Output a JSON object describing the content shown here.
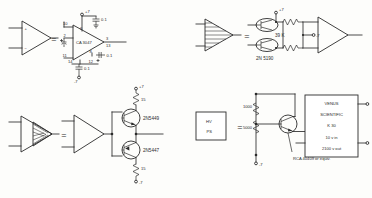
{
  "sheet": {
    "title": "Circuit symbol equivalence definitions",
    "equals_sign": "=",
    "line_color": "#2b2b2b",
    "background_color": "#fdfdfb"
  },
  "circuits": [
    {
      "id": "opamp",
      "name": "Operational amplifier equivalence",
      "symbol": {
        "type": "triangle-amplifier",
        "input_plus": "+",
        "input_minus": "−"
      },
      "device_label": "CA 3047",
      "pins": {
        "left_top": "10",
        "left_mid": "2",
        "left_bottom": "11",
        "right_top": "3",
        "right_mid": "13",
        "inner_top": "6",
        "inner_bottom": "8",
        "bottom_left": "14",
        "bottom_right": "12"
      },
      "supplies": {
        "positive": "+7",
        "negative": "-7"
      },
      "capacitors": [
        {
          "value": "0.1",
          "position": "top"
        },
        {
          "value": "0.1",
          "position": "right"
        },
        {
          "value": "0.1",
          "position": "bottom"
        }
      ]
    },
    {
      "id": "hatched-amp",
      "name": "Hatched driver amplifier equivalence",
      "symbol": {
        "type": "triangle-amplifier-hatched"
      },
      "device_label": "2N 5190",
      "resistor_value": "39 K",
      "supplies": {
        "positive": "+7",
        "negative": "-7"
      }
    },
    {
      "id": "power-buffer",
      "name": "Complementary emitter follower buffer equivalence",
      "symbol": {
        "type": "triangle-amplifier-shaded"
      },
      "transistors": [
        {
          "label": "2N5449",
          "polarity": "npn"
        },
        {
          "label": "2N5447",
          "polarity": "pnp"
        }
      ],
      "resistors": [
        {
          "value": "15",
          "position": "top"
        },
        {
          "value": "15",
          "position": "bottom"
        }
      ],
      "supplies": {
        "positive": "+7",
        "negative": "-7"
      }
    },
    {
      "id": "hv-ps",
      "name": "High voltage power supply equivalence",
      "symbol": {
        "type": "box",
        "line1": "HV",
        "line2": "PS"
      },
      "module": {
        "brand_line1": "VENUS",
        "brand_line2": "SCIENTIFIC",
        "model": "K 30",
        "input_spec": "10 v in",
        "output_spec": "2100 v out"
      },
      "resistors": [
        {
          "value": "1000",
          "position": "upper"
        },
        {
          "value": "5000",
          "position": "lower"
        }
      ],
      "transistor_note": "RCA  40409 or equiv.",
      "supplies": {
        "negative": "-7"
      }
    }
  ]
}
